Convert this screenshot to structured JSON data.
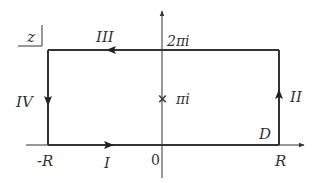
{
  "diagram": {
    "plane_label": "z",
    "segments": {
      "I": "I",
      "II": "II",
      "III": "III",
      "IV": "IV"
    },
    "points": {
      "top_label": "2πi",
      "pole_label": "πi",
      "pole_marker": "×",
      "neg_R": "-R",
      "origin": "0",
      "pos_R": "R",
      "region": "D"
    },
    "colors": {
      "stroke": "#333333",
      "background": "#ffffff"
    }
  }
}
